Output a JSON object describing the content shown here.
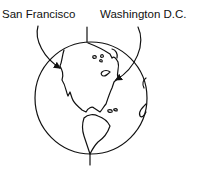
{
  "diagram": {
    "labels": {
      "left": "San Francisco",
      "right": "Washington D.C."
    },
    "colors": {
      "stroke": "#111111",
      "background": "#ffffff"
    }
  }
}
